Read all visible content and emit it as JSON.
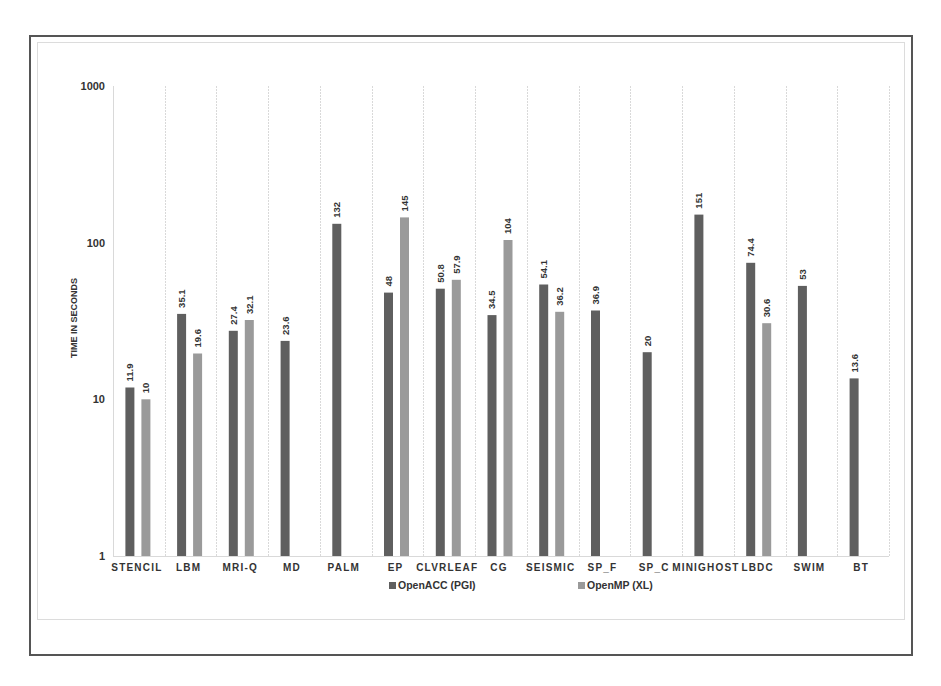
{
  "chart_data": {
    "type": "bar",
    "title": "",
    "xlabel": "",
    "ylabel": "TIME IN SECONDS",
    "yscale": "log",
    "ylim": [
      1,
      1000
    ],
    "yticks": [
      1,
      10,
      100,
      1000
    ],
    "ytick_labels": [
      "1",
      "10",
      "100",
      "1000"
    ],
    "grid": {
      "vertical": true,
      "horizontal": false
    },
    "legend_position": "bottom",
    "categories": [
      "STENCIL",
      "LBM",
      "MRI-Q",
      "MD",
      "PALM",
      "EP",
      "CLVRLEAF",
      "CG",
      "SEISMIC",
      "SP_F",
      "SP_C",
      "MINIGHOST",
      "LBDC",
      "SWIM",
      "BT"
    ],
    "series": [
      {
        "name": "OpenACC (PGI)",
        "color": "#5f5f5f",
        "values": [
          11.9,
          35.1,
          27.4,
          23.6,
          132,
          48,
          50.8,
          34.5,
          54.1,
          36.9,
          20,
          151,
          74.4,
          53,
          13.6
        ],
        "labels": [
          "11.9",
          "35.1",
          "27.4",
          "23.6",
          "132",
          "48",
          "50.8",
          "34.5",
          "54.1",
          "36.9",
          "20",
          "151",
          "74.4",
          "53",
          "13.6"
        ]
      },
      {
        "name": "OpenMP (XL)",
        "color": "#9a9a9a",
        "values": [
          10,
          19.6,
          32.1,
          null,
          null,
          145,
          57.9,
          104,
          36.2,
          null,
          null,
          null,
          30.6,
          null,
          null
        ],
        "labels": [
          "10",
          "19.6",
          "32.1",
          null,
          null,
          "145",
          "57.9",
          "104",
          "36.2",
          null,
          null,
          null,
          "30.6",
          null,
          null
        ]
      }
    ]
  },
  "colors": {
    "frame": "#555555",
    "inner_frame": "#dcdcdc",
    "gridline": "#d9d9d9",
    "text": "#333333"
  }
}
